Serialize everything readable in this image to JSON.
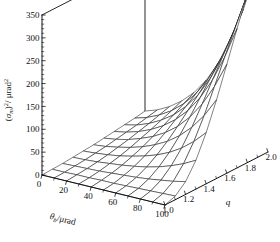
{
  "chart_data": {
    "type": "surface3d",
    "title": "",
    "zlabel": "(σ_m)² / μrad²",
    "zlabel_parts": {
      "open": "(",
      "sigma": "σ",
      "sigma_sub": "m",
      "close": ")",
      "exp": "2",
      "slash": "/ μrad",
      "unit_exp": "2"
    },
    "xlabel": "θ_b / μrad",
    "xlabel_parts": {
      "theta": "θ",
      "theta_sub": "b",
      "unit": "/μrad"
    },
    "ylabel": "q",
    "zticks": [
      0,
      50,
      100,
      150,
      200,
      250,
      300,
      350
    ],
    "ztick_labels": [
      "0",
      "50",
      "100",
      "150",
      "200",
      "250",
      "300",
      "350"
    ],
    "zlim": [
      0,
      350
    ],
    "xticks": [
      0,
      20,
      40,
      60,
      80,
      100
    ],
    "xtick_labels": [
      "0",
      "20",
      "40",
      "60",
      "80",
      "100"
    ],
    "xlim": [
      0,
      100
    ],
    "yticks": [
      1.0,
      1.2,
      1.4,
      1.6,
      1.8,
      2.0
    ],
    "ytick_labels": [
      "1.0",
      "1.2",
      "1.4",
      "1.6",
      "1.8",
      "2.0"
    ],
    "ylim": [
      1.0,
      2.0
    ],
    "grid": false,
    "legend": false,
    "mesh": {
      "nx": 11,
      "ny": 11,
      "line_color": "#1a1a1a",
      "face_color": "#ffffff"
    },
    "x": [
      0,
      10,
      20,
      30,
      40,
      50,
      60,
      70,
      80,
      90,
      100
    ],
    "y": [
      1.0,
      1.1,
      1.2,
      1.3,
      1.4,
      1.5,
      1.6,
      1.7,
      1.8,
      1.9,
      2.0
    ],
    "z": [
      [
        0,
        0,
        0,
        0,
        0,
        0,
        0,
        0,
        0,
        0,
        0
      ],
      [
        1,
        1,
        2,
        2,
        3,
        3,
        4,
        5,
        6,
        7,
        8
      ],
      [
        2,
        3,
        4,
        5,
        7,
        9,
        11,
        14,
        18,
        22,
        28
      ],
      [
        4,
        5,
        7,
        10,
        13,
        17,
        22,
        29,
        38,
        49,
        63
      ],
      [
        6,
        8,
        11,
        15,
        21,
        28,
        37,
        49,
        65,
        86,
        112
      ],
      [
        8,
        11,
        16,
        22,
        30,
        41,
        55,
        74,
        99,
        131,
        172
      ],
      [
        11,
        15,
        21,
        30,
        41,
        56,
        76,
        103,
        138,
        183,
        238
      ],
      [
        14,
        19,
        27,
        38,
        53,
        73,
        99,
        134,
        179,
        236,
        305
      ],
      [
        17,
        23,
        33,
        47,
        65,
        90,
        122,
        165,
        219,
        287,
        369
      ],
      [
        20,
        28,
        40,
        56,
        78,
        107,
        146,
        196,
        259,
        337,
        430
      ],
      [
        24,
        33,
        47,
        66,
        91,
        125,
        170,
        227,
        299,
        386,
        487
      ]
    ]
  },
  "axes": {
    "z_axis_name": "z-axis",
    "x_axis_name": "x-axis",
    "y_axis_name": "y-axis"
  }
}
